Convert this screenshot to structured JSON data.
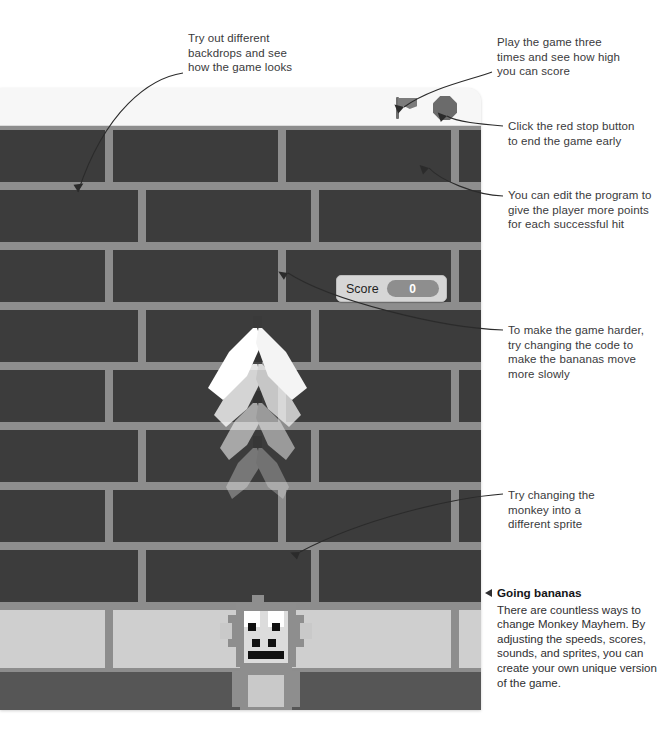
{
  "annotations": [
    {
      "id": "backdrops",
      "text": "Try out different\nbackdrops and see\nhow the game looks"
    },
    {
      "id": "play-three",
      "text": "Play the game three\ntimes and see how high\nyou can score"
    },
    {
      "id": "stop-early",
      "text": "Click the red stop button\nto end the game early"
    },
    {
      "id": "more-points",
      "text": "You can edit the program to\ngive the player more points\nfor each successful hit"
    },
    {
      "id": "harder",
      "text": "To make the game harder,\ntry changing the code to\nmake the bananas move\nmore slowly"
    },
    {
      "id": "sprite",
      "text": "Try changing the\nmonkey into a\ndifferent sprite"
    }
  ],
  "caption": {
    "marker": "triangle-left",
    "heading": "Going bananas",
    "body": "There are countless ways to change Monkey Mayhem. By adjusting the speeds, scores, sounds, and sprites, you can create your own unique version of the game."
  },
  "window": {
    "controls": {
      "green_flag": "green-flag",
      "stop_button": "stop-sign"
    }
  },
  "stage": {
    "score": {
      "label": "Score",
      "value": "0"
    },
    "backdrop": "brick-wall",
    "sprites": [
      "bananas",
      "monkey"
    ]
  },
  "colors": {
    "brick_dark": "#3c3c3c",
    "brick_light": "#cfcfcf",
    "mortar": "#8d8d8d",
    "floor": "#565656",
    "note_text": "#3a3a3c",
    "heading_text": "#151517",
    "score_chip": "#8e8e8e"
  }
}
